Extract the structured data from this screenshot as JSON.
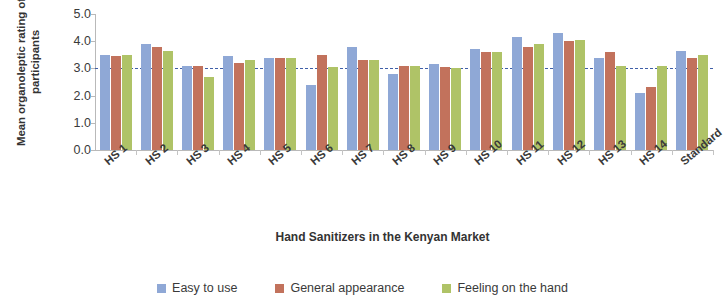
{
  "chart_data": {
    "type": "bar",
    "title": "",
    "xlabel": "Hand Sanitizers in the Kenyan Market",
    "ylabel": "Mean organoleptic rating of the participants",
    "ylabel_line1": "Mean organoleptic rating of the",
    "ylabel_line2": "participants",
    "ylim": [
      0.0,
      5.0
    ],
    "ytick_labels": [
      "5.0",
      "4.0",
      "3.0",
      "2.0",
      "1.0",
      "0.0"
    ],
    "ytick_values": [
      5.0,
      4.0,
      3.0,
      2.0,
      1.0,
      0.0
    ],
    "grid": false,
    "legend_position": "bottom",
    "reference_line": {
      "value": 3.0,
      "style": "dashed",
      "color": "#3f5fa8"
    },
    "categories": [
      "HS 1",
      "HS 2",
      "HS 3",
      "HS 4",
      "HS 5",
      "HS 6",
      "HS 7",
      "HS 8",
      "HS 9",
      "HS 10",
      "HS 11",
      "HS 12",
      "HS 13",
      "HS 14",
      "Standard"
    ],
    "series": [
      {
        "name": "Easy to use",
        "color": "#8fa8d6",
        "values": [
          3.5,
          3.9,
          3.1,
          3.45,
          3.4,
          2.4,
          3.8,
          2.8,
          3.15,
          3.7,
          4.15,
          4.3,
          3.4,
          2.1,
          3.65
        ]
      },
      {
        "name": "General appearance",
        "color": "#c2725c",
        "values": [
          3.45,
          3.8,
          3.1,
          3.2,
          3.4,
          3.5,
          3.3,
          3.1,
          3.05,
          3.6,
          3.8,
          4.0,
          3.6,
          2.3,
          3.4
        ]
      },
      {
        "name": "Feeling on the hand",
        "color": "#afc367",
        "values": [
          3.5,
          3.65,
          2.7,
          3.3,
          3.4,
          3.05,
          3.3,
          3.1,
          3.0,
          3.6,
          3.9,
          4.05,
          3.1,
          3.1,
          3.5
        ]
      }
    ]
  },
  "legend": {
    "items": [
      {
        "label": "Easy to use",
        "color": "#8fa8d6"
      },
      {
        "label": "General appearance",
        "color": "#c2725c"
      },
      {
        "label": "Feeling on the hand",
        "color": "#afc367"
      }
    ]
  }
}
